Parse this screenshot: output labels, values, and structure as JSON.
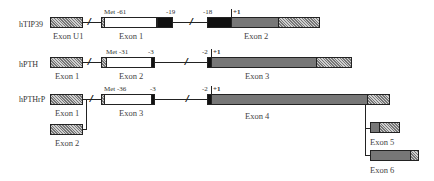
{
  "genes": [
    {
      "name": "hTIP39",
      "exons": [
        {
          "label": "Exon U1"
        },
        {
          "label": "Exon 1",
          "start_marker": "Met -61",
          "end_marker": "-19"
        },
        {
          "label": "Exon 2",
          "start_marker": "-18",
          "plus_one": "+1"
        }
      ]
    },
    {
      "name": "hPTH",
      "exons": [
        {
          "label": "Exon 1"
        },
        {
          "label": "Exon 2",
          "start_marker": "Met -31",
          "end_marker": "-3"
        },
        {
          "label": "Exon 3",
          "start_marker": "-2",
          "plus_one": "+1"
        }
      ]
    },
    {
      "name": "hPTHrP",
      "exons": [
        {
          "label": "Exon 1"
        },
        {
          "label": "Exon 2"
        },
        {
          "label": "Exon 3",
          "start_marker": "Met -36",
          "end_marker": "-3"
        },
        {
          "label": "Exon 4",
          "start_marker": "-2",
          "plus_one": "+1"
        },
        {
          "label": "Exon 5"
        },
        {
          "label": "Exon 6"
        }
      ]
    }
  ],
  "legend_colors": {
    "untranslated_hatched": "#a0a0a0",
    "prepro_white": "#ffffff",
    "pro_black": "#111111",
    "mature_gray": "#777777"
  },
  "break_symbol": "//"
}
